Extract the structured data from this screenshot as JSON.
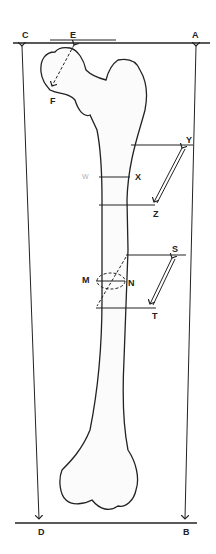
{
  "diagram": {
    "labels": {
      "A": "A",
      "B": "B",
      "C": "C",
      "D": "D",
      "E": "E",
      "F": "F",
      "X": "X",
      "Y": "Y",
      "Z": "Z",
      "M": "M",
      "N": "N",
      "S": "S",
      "T": "T",
      "W": "W"
    },
    "colors": {
      "line": "#222222",
      "faint_label": "#b0b0b0",
      "background": "#ffffff"
    }
  }
}
